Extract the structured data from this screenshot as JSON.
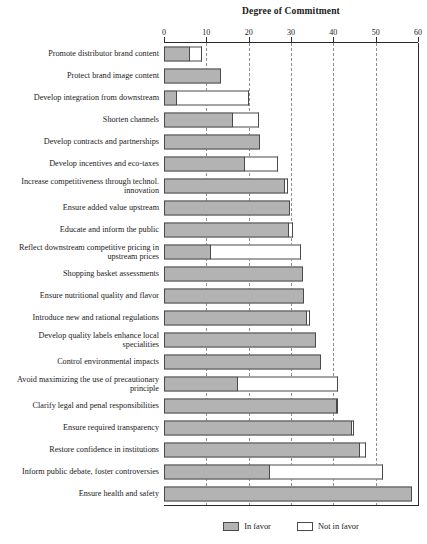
{
  "chart_data": {
    "type": "bar",
    "orientation": "horizontal",
    "stacked": true,
    "title": "Degree of Commitment",
    "xlabel": "",
    "ylabel": "",
    "xlim": [
      0,
      60
    ],
    "xticks": [
      0,
      10,
      20,
      30,
      40,
      50,
      60
    ],
    "xtick_labels": [
      "0",
      "10",
      "20",
      "30",
      "40",
      "50",
      "60"
    ],
    "grid": "vertical-dashed",
    "legend_position": "bottom-center",
    "categories": [
      "Promote distributor brand content",
      "Protect brand image content",
      "Develop integration from downstream",
      "Shorten channels",
      "Develop contracts and partnerships",
      "Develop incentives and eco-taxes",
      "Increase competitiveness through technol. innovation",
      "Ensure added value upstream",
      "Educate and inform the public",
      "Reflect downstream competitive pricing in upstream prices",
      "Shopping basket assessments",
      "Ensure nutritional quality and flavor",
      "Introduce new and rational regulations",
      "Develop quality labels enhance local specialities",
      "Control environmental impacts",
      "Avoid maximizing the use of precautionary principle",
      "Clarify legal and penal responsibilities",
      "Ensure required transparency",
      "Restore confidence in institutions",
      "Inform public debate, foster controversies",
      "Ensure health and safety"
    ],
    "series": [
      {
        "name": "In favor",
        "color": "#b3b3b3",
        "values": [
          6.2,
          13.5,
          3.0,
          16.3,
          22.7,
          19.2,
          28.6,
          29.8,
          29.6,
          11.0,
          32.8,
          33.0,
          33.8,
          36.0,
          37.0,
          17.5,
          40.8,
          44.4,
          46.3,
          25.0,
          58.6
        ]
      },
      {
        "name": "Not in favor",
        "color": "#ffffff",
        "values": [
          2.8,
          0.0,
          17.0,
          6.2,
          0.0,
          7.8,
          0.7,
          0.0,
          0.8,
          21.4,
          0.0,
          0.0,
          0.7,
          0.0,
          0.0,
          23.5,
          0.2,
          0.6,
          1.4,
          26.7,
          0.0
        ]
      }
    ]
  },
  "legend": {
    "items": [
      {
        "label": "In favor",
        "swatch": "favor"
      },
      {
        "label": "Not in favor",
        "swatch": "against"
      }
    ]
  }
}
